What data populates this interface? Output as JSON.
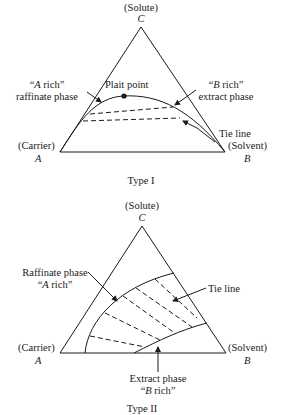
{
  "type1": {
    "caption": "Type I",
    "vertex_c": {
      "name": "(Solute)",
      "letter": "C"
    },
    "vertex_a": {
      "name": "(Carrier)",
      "letter": "A"
    },
    "vertex_b": {
      "name": "(Solvent)",
      "letter": "B"
    },
    "raffinate": {
      "line1_q": "“",
      "line1_it": "A",
      "line1_rest": " rich”",
      "line2": "raffinate phase"
    },
    "extract": {
      "line1_q": "“",
      "line1_it": "B",
      "line1_rest": " rich”",
      "line2": "extract phase"
    },
    "plait_point": "Plait point",
    "tie_line": "Tie line"
  },
  "type2": {
    "caption": "Type II",
    "vertex_c": {
      "name": "(Solute)",
      "letter": "C"
    },
    "vertex_a": {
      "name": "(Carrier)",
      "letter": "A"
    },
    "vertex_b": {
      "name": "(Solvent)",
      "letter": "B"
    },
    "raffinate": {
      "line1": "Raffinate phase",
      "line2_q": "“",
      "line2_it": "A",
      "line2_rest": " rich”"
    },
    "extract": {
      "line1": "Extract phase",
      "line2_q": "“",
      "line2_it": "B",
      "line2_rest": " rich”"
    },
    "tie_line": "Tie line"
  },
  "colors": {
    "line": "#1a1a1a",
    "background": "#ffffff"
  }
}
